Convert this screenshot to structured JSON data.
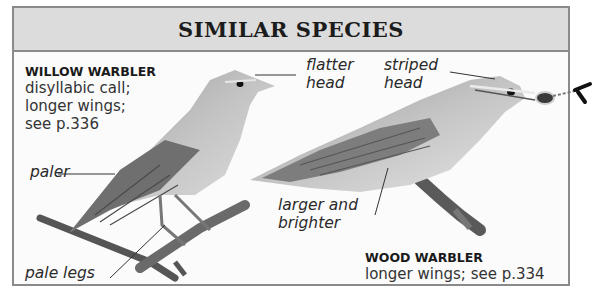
{
  "panel": {
    "title": "SIMILAR SPECIES"
  },
  "species": [
    {
      "name": "WILLOW WARBLER",
      "description": "disyllabic call;\nlonger wings;\nsee p.336",
      "labels": [
        "flatter\nhead",
        "paler",
        "pale legs"
      ]
    },
    {
      "name": "WOOD WARBLER",
      "description": "longer wings; see p.334",
      "labels": [
        "striped\nhead",
        "larger and\nbrighter"
      ]
    }
  ],
  "colors": {
    "header_bg": "#dcdcdc",
    "border": "#8a8a8a",
    "panel_bg": "#fbfbfb"
  }
}
